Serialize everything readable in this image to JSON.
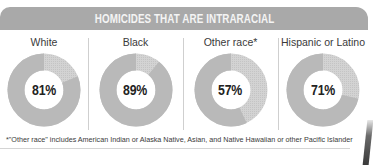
{
  "header": {
    "title": "HOMICIDES THAT ARE INTRARACIAL"
  },
  "columns": [
    {
      "label": "White",
      "value_label": "81%"
    },
    {
      "label": "Black",
      "value_label": "89%"
    },
    {
      "label": "Other race*",
      "value_label": "57%"
    },
    {
      "label": "Hispanic or Latino",
      "value_label": "71%"
    }
  ],
  "footnote": "*\"Other race\" includes American Indian or Alaska Native, Asian, and Native Hawaiian or other Pacific Islander",
  "colors": {
    "header_bg": "#a9a9a9",
    "header_text": "#f4f4f4",
    "ring_main": "#b9b9b9",
    "ring_rest": "#d3d3d3",
    "divider": "#cfcfcf"
  },
  "chart_data": {
    "type": "pie",
    "subtype": "donut",
    "title": "HOMICIDES THAT ARE INTRARACIAL",
    "categories": [
      "White",
      "Black",
      "Other race*",
      "Hispanic or Latino"
    ],
    "values": [
      81,
      89,
      57,
      71
    ],
    "unit": "%",
    "series": [
      {
        "name": "Intraracial",
        "values": [
          81,
          89,
          57,
          71
        ]
      },
      {
        "name": "Other",
        "values": [
          19,
          11,
          43,
          29
        ]
      }
    ],
    "annotations": [
      "*\"Other race\" includes American Indian or Alaska Native, Asian, and Native Hawaiian or other Pacific Islander"
    ],
    "legend": "none",
    "grid": false
  }
}
